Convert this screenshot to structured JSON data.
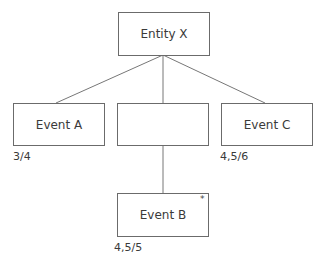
{
  "diagram": {
    "root": {
      "label": "Entity X"
    },
    "children": [
      {
        "label": "Event A",
        "annotation": "3/4"
      },
      {
        "label": "",
        "annotation": ""
      },
      {
        "label": "Event C",
        "annotation": "4,5/6"
      }
    ],
    "grandchild": {
      "label": "Event B",
      "annotation": "4,5/5",
      "marker": "*"
    }
  }
}
